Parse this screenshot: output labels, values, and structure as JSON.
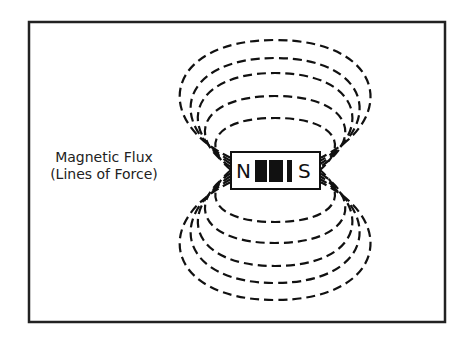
{
  "diagram": {
    "label": {
      "line1": "Magnetic Flux",
      "line2": "(Lines of Force)"
    },
    "magnet": {
      "north": "N",
      "south": "S"
    },
    "loops_above": 5,
    "loops_below": 5,
    "line_style": "dashed",
    "colors": {
      "line": "#111111",
      "background": "#ffffff"
    }
  }
}
